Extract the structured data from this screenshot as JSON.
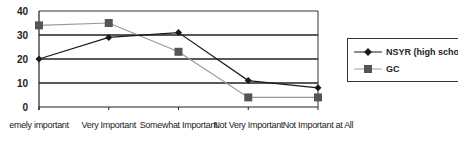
{
  "chart_data": {
    "type": "line",
    "title": "",
    "xlabel": "",
    "ylabel": "",
    "ylim": [
      0,
      40
    ],
    "yticks": [
      0,
      10,
      20,
      30,
      40
    ],
    "grid": true,
    "legend_position": "right",
    "categories": [
      "Extremely important",
      "Very Important",
      "Somewhat Important",
      "Not Very Important",
      "Not Important at All"
    ],
    "visible_category_labels": [
      "emely important",
      "Very Important",
      "Somewhat Important",
      "Not Very Important",
      "Not Important at All"
    ],
    "series": [
      {
        "name": "NSYR (high school)",
        "legend_label": "NSYR (high scho",
        "marker": "diamond",
        "color": "#1a1a1a",
        "values": [
          20,
          29,
          31,
          11,
          8
        ]
      },
      {
        "name": "GC",
        "legend_label": "GC",
        "marker": "square",
        "color": "#999999",
        "marker_color": "#555555",
        "values": [
          34,
          35,
          23,
          4,
          4
        ]
      }
    ]
  }
}
